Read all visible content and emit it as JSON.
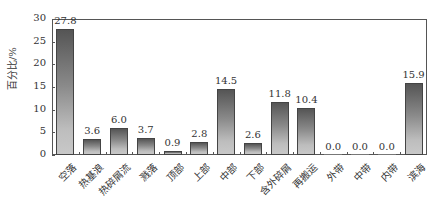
{
  "chart_data": {
    "type": "bar",
    "title": "",
    "xlabel": "",
    "ylabel": "百分比/%",
    "ylim": [
      0,
      30
    ],
    "yticks": [
      0,
      5,
      10,
      15,
      20,
      25,
      30
    ],
    "grid": false,
    "legend": null,
    "categories": [
      "空落",
      "热基浪",
      "热碎屑流",
      "溅落",
      "顶部",
      "上部",
      "中部",
      "下部",
      "含外碎屑",
      "再搬运",
      "外带",
      "中带",
      "内带",
      "滨海"
    ],
    "values": [
      27.8,
      3.6,
      6.0,
      3.7,
      0.9,
      2.8,
      14.5,
      2.6,
      11.8,
      10.4,
      0.0,
      0.0,
      0.0,
      15.9
    ],
    "value_labels": [
      "27.8",
      "3.6",
      "6.0",
      "3.7",
      "0.9",
      "2.8",
      "14.5",
      "2.6",
      "11.8",
      "10.4",
      "0.0",
      "0.0",
      "0.0",
      "15.9"
    ]
  },
  "colors": {
    "bar_top": "#555555",
    "bar_bottom": "#c8c8c8",
    "axis": "#555555"
  }
}
